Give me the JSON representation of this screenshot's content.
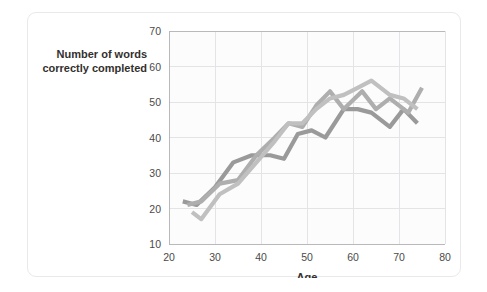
{
  "figure": {
    "card_label": "chart-card"
  },
  "chart_data": {
    "type": "line",
    "title": "",
    "subtitle": "",
    "xlabel": "Age",
    "ylabel": "Number of words correctly completed",
    "ylabel_line1": "Number of words",
    "ylabel_line2": "correctly completed",
    "xlim": [
      20,
      80
    ],
    "ylim": [
      10,
      70
    ],
    "xticks": [
      20,
      30,
      40,
      50,
      60,
      70,
      80
    ],
    "xticklabels": [
      "20",
      "30",
      "40",
      "50",
      "60",
      "70",
      "80"
    ],
    "yticks": [
      10,
      20,
      30,
      40,
      50,
      60,
      70
    ],
    "yticklabels": [
      "10",
      "20",
      "30",
      "40",
      "50",
      "60",
      "70"
    ],
    "grid": true,
    "legend": "none",
    "colors": {
      "series_1": "#9a9a9a",
      "series_2": "#aeaeae",
      "series_3": "#c0c0c0",
      "gridline": "#e4e4e6",
      "axis": "#b9b9bb",
      "plot_background": "#fcfcfc",
      "card_border": "#e9e9ea",
      "text": "#33302e"
    },
    "series": [
      {
        "name": "series-1",
        "color": "#9a9a9a",
        "x": [
          23,
          26,
          30,
          34,
          38,
          42,
          45,
          48,
          51,
          54,
          58,
          61,
          64,
          68,
          71,
          74
        ],
        "y": [
          22,
          21,
          26,
          33,
          35,
          35,
          34,
          41,
          42,
          40,
          48,
          48,
          47,
          43,
          48,
          44
        ]
      },
      {
        "name": "series-2",
        "color": "#aeaeae",
        "x": [
          24,
          27,
          31,
          35,
          39,
          43,
          46,
          49,
          52,
          55,
          58,
          62,
          65,
          68,
          72,
          75
        ],
        "y": [
          21,
          22,
          27,
          28,
          35,
          40,
          44,
          43,
          49,
          53,
          48,
          53,
          48,
          51,
          47,
          54
        ]
      },
      {
        "name": "series-3",
        "color": "#c0c0c0",
        "x": [
          25,
          27,
          31,
          35,
          39,
          43,
          46,
          49,
          52,
          55,
          58,
          61,
          64,
          68,
          71,
          74
        ],
        "y": [
          19,
          17,
          24,
          27,
          33,
          39,
          44,
          44,
          48,
          51,
          52,
          54,
          56,
          52,
          51,
          48
        ]
      }
    ]
  }
}
